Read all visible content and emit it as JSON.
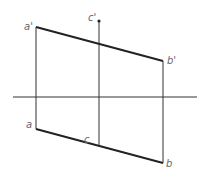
{
  "diagram": {
    "title": "",
    "labels": {
      "a_prime": "a'",
      "b_prime": "b'",
      "c_prime": "c'",
      "a": "a",
      "b": "b",
      "c": "c"
    },
    "colors": {
      "line": "#222222",
      "thin_line": "#333333",
      "label": "#666666"
    }
  }
}
